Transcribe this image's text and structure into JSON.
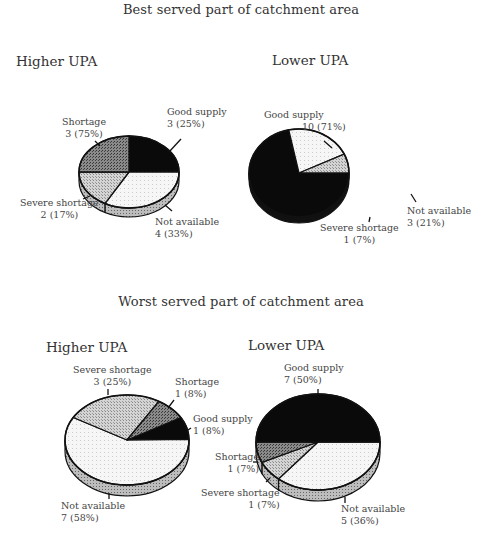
{
  "sections": [
    {
      "title": "Best served part of catchment area"
    },
    {
      "title": "Worst served part of catchment area"
    }
  ],
  "colors": {
    "Good supply": "#0a0a0a",
    "Shortage": "#6e6e6e",
    "Severe shortage": "#c4c4c4",
    "Not available": "#efefef"
  },
  "chart_data": [
    {
      "type": "pie",
      "title": "Best served part of catchment area — Higher UPA",
      "section": "Best served part of catchment area",
      "subtitle": "Higher UPA",
      "slices": [
        {
          "label": "Good supply",
          "count": 3,
          "percent_text": "3 (25%)",
          "value": 25
        },
        {
          "label": "Not available",
          "count": 4,
          "percent_text": "4 (33%)",
          "value": 33
        },
        {
          "label": "Severe shortage",
          "count": 2,
          "percent_text": "2 (17%)",
          "value": 17
        },
        {
          "label": "Shortage",
          "count": 3,
          "percent_text": "3 (75%)",
          "value": 25
        }
      ]
    },
    {
      "type": "pie",
      "title": "Best served part of catchment area — Lower UPA",
      "section": "Best served part of catchment area",
      "subtitle": "Lower UPA",
      "slices": [
        {
          "label": "Good supply",
          "count": 10,
          "percent_text": "10 (71%)",
          "value": 71
        },
        {
          "label": "Not available",
          "count": 3,
          "percent_text": "3 (21%)",
          "value": 21
        },
        {
          "label": "Severe shortage",
          "count": 1,
          "percent_text": "1 (7%)",
          "value": 7
        }
      ]
    },
    {
      "type": "pie",
      "title": "Worst served part of catchment area — Higher UPA",
      "section": "Worst served part of catchment area",
      "subtitle": "Higher UPA",
      "slices": [
        {
          "label": "Good supply",
          "count": 1,
          "percent_text": "1 (8%)",
          "value": 8
        },
        {
          "label": "Not available",
          "count": 7,
          "percent_text": "7 (58%)",
          "value": 58
        },
        {
          "label": "Severe shortage",
          "count": 3,
          "percent_text": "3 (25%)",
          "value": 25
        },
        {
          "label": "Shortage",
          "count": 1,
          "percent_text": "1 (8%)",
          "value": 8
        }
      ]
    },
    {
      "type": "pie",
      "title": "Worst served part of catchment area — Lower UPA",
      "section": "Worst served part of catchment area",
      "subtitle": "Lower UPA",
      "slices": [
        {
          "label": "Not available",
          "count": 5,
          "percent_text": "5 (36%)",
          "value": 36
        },
        {
          "label": "Severe shortage",
          "count": 1,
          "percent_text": "1 (7%)",
          "value": 7
        },
        {
          "label": "Shortage",
          "count": 1,
          "percent_text": "1 (7%)",
          "value": 7
        },
        {
          "label": "Good supply",
          "count": 7,
          "percent_text": "7 (50%)",
          "value": 50
        }
      ]
    }
  ]
}
